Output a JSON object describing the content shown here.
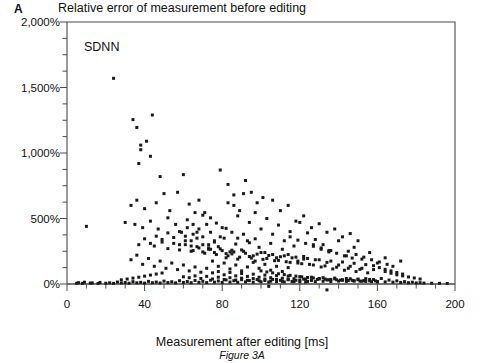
{
  "panel": {
    "label": "A"
  },
  "header": {
    "title": "Relative error of measurement before editing"
  },
  "caption": {
    "text": "Figure 3A"
  },
  "colors": {
    "marker": "#1a1a1a",
    "axis": "#4a4a4a",
    "background": "#ffffff",
    "text": "#111111"
  },
  "chart_data": {
    "type": "scatter",
    "title": "Relative error of measurement before editing",
    "series_label": "SDNN",
    "xlabel": "Measurement after editing [ms]",
    "ylabel": "",
    "xlim": [
      0,
      200
    ],
    "ylim": [
      0,
      2000
    ],
    "grid": false,
    "legend": "none",
    "x_major_ticks": [
      0,
      40,
      80,
      120,
      160,
      200
    ],
    "x_tick_labels": [
      "0",
      "40",
      "80",
      "120",
      "160",
      "200"
    ],
    "x_minor_step": 10,
    "y_major_ticks": [
      0,
      500,
      1000,
      1500,
      2000
    ],
    "y_tick_labels": [
      "0%",
      "500%",
      "1,000%",
      "1,500%",
      "2,000%"
    ],
    "y_minor_step": 125,
    "y_unit": "%",
    "marker": "square",
    "marker_size_px": 3,
    "n_points": 430,
    "points": [
      [
        10,
        440
      ],
      [
        24,
        1570
      ],
      [
        34,
        1255
      ],
      [
        36,
        1195
      ],
      [
        38,
        1060
      ],
      [
        38,
        1025
      ],
      [
        37,
        920
      ],
      [
        44,
        1290
      ],
      [
        41,
        1090
      ],
      [
        43,
        975
      ],
      [
        48,
        820
      ],
      [
        50,
        690
      ],
      [
        36,
        640
      ],
      [
        46,
        620
      ],
      [
        33,
        600
      ],
      [
        40,
        575
      ],
      [
        53,
        560
      ],
      [
        57,
        700
      ],
      [
        60,
        835
      ],
      [
        63,
        610
      ],
      [
        66,
        545
      ],
      [
        30,
        470
      ],
      [
        35,
        455
      ],
      [
        39,
        430
      ],
      [
        43,
        480
      ],
      [
        47,
        420
      ],
      [
        52,
        505
      ],
      [
        56,
        455
      ],
      [
        59,
        395
      ],
      [
        62,
        430
      ],
      [
        65,
        380
      ],
      [
        68,
        640
      ],
      [
        70,
        525
      ],
      [
        72,
        455
      ],
      [
        74,
        395
      ],
      [
        58,
        300
      ],
      [
        61,
        330
      ],
      [
        64,
        290
      ],
      [
        67,
        350
      ],
      [
        70,
        300
      ],
      [
        73,
        265
      ],
      [
        76,
        320
      ],
      [
        79,
        870
      ],
      [
        83,
        760
      ],
      [
        86,
        600
      ],
      [
        88,
        520
      ],
      [
        91,
        690
      ],
      [
        94,
        470
      ],
      [
        97,
        545
      ],
      [
        100,
        420
      ],
      [
        103,
        500
      ],
      [
        106,
        380
      ],
      [
        109,
        450
      ],
      [
        112,
        330
      ],
      [
        115,
        400
      ],
      [
        78,
        285
      ],
      [
        81,
        350
      ],
      [
        84,
        245
      ],
      [
        87,
        305
      ],
      [
        90,
        260
      ],
      [
        93,
        330
      ],
      [
        96,
        215
      ],
      [
        99,
        280
      ],
      [
        102,
        240
      ],
      [
        105,
        310
      ],
      [
        108,
        200
      ],
      [
        111,
        265
      ],
      [
        114,
        225
      ],
      [
        117,
        290
      ],
      [
        120,
        470
      ],
      [
        124,
        390
      ],
      [
        128,
        340
      ],
      [
        132,
        300
      ],
      [
        136,
        255
      ],
      [
        140,
        330
      ],
      [
        144,
        215
      ],
      [
        148,
        280
      ],
      [
        152,
        190
      ],
      [
        156,
        240
      ],
      [
        160,
        160
      ],
      [
        164,
        200
      ],
      [
        168,
        135
      ],
      [
        172,
        175
      ],
      [
        119,
        175
      ],
      [
        122,
        210
      ],
      [
        125,
        150
      ],
      [
        128,
        185
      ],
      [
        131,
        130
      ],
      [
        134,
        165
      ],
      [
        137,
        115
      ],
      [
        140,
        145
      ],
      [
        143,
        105
      ],
      [
        146,
        135
      ],
      [
        149,
        95
      ],
      [
        152,
        120
      ],
      [
        155,
        85
      ],
      [
        158,
        110
      ],
      [
        33,
        185
      ],
      [
        36,
        220
      ],
      [
        39,
        150
      ],
      [
        42,
        195
      ],
      [
        45,
        135
      ],
      [
        48,
        175
      ],
      [
        51,
        120
      ],
      [
        54,
        160
      ],
      [
        57,
        110
      ],
      [
        60,
        145
      ],
      [
        63,
        100
      ],
      [
        66,
        130
      ],
      [
        69,
        90
      ],
      [
        72,
        120
      ],
      [
        75,
        175
      ],
      [
        78,
        135
      ],
      [
        81,
        160
      ],
      [
        84,
        115
      ],
      [
        87,
        145
      ],
      [
        90,
        100
      ],
      [
        93,
        130
      ],
      [
        96,
        165
      ],
      [
        99,
        120
      ],
      [
        102,
        150
      ],
      [
        105,
        105
      ],
      [
        108,
        135
      ],
      [
        111,
        95
      ],
      [
        114,
        125
      ],
      [
        75,
        85
      ],
      [
        78,
        95
      ],
      [
        81,
        70
      ],
      [
        84,
        88
      ],
      [
        87,
        62
      ],
      [
        90,
        80
      ],
      [
        93,
        58
      ],
      [
        96,
        75
      ],
      [
        99,
        52
      ],
      [
        102,
        68
      ],
      [
        105,
        48
      ],
      [
        108,
        64
      ],
      [
        111,
        44
      ],
      [
        114,
        60
      ],
      [
        117,
        40
      ],
      [
        120,
        56
      ],
      [
        123,
        38
      ],
      [
        126,
        52
      ],
      [
        129,
        35
      ],
      [
        132,
        48
      ],
      [
        135,
        32
      ],
      [
        138,
        45
      ],
      [
        141,
        30
      ],
      [
        144,
        42
      ],
      [
        147,
        28
      ],
      [
        150,
        38
      ],
      [
        153,
        26
      ],
      [
        156,
        35
      ],
      [
        159,
        24
      ],
      [
        60,
        55
      ],
      [
        63,
        48
      ],
      [
        66,
        62
      ],
      [
        69,
        42
      ],
      [
        72,
        58
      ],
      [
        75,
        38
      ],
      [
        78,
        52
      ],
      [
        81,
        34
      ],
      [
        84,
        48
      ],
      [
        87,
        30
      ],
      [
        90,
        45
      ],
      [
        93,
        28
      ],
      [
        96,
        42
      ],
      [
        99,
        25
      ],
      [
        102,
        38
      ],
      [
        105,
        22
      ],
      [
        108,
        35
      ],
      [
        111,
        20
      ],
      [
        114,
        32
      ],
      [
        117,
        18
      ],
      [
        120,
        30
      ],
      [
        123,
        16
      ],
      [
        126,
        28
      ],
      [
        6,
        10
      ],
      [
        9,
        14
      ],
      [
        13,
        8
      ],
      [
        17,
        12
      ],
      [
        22,
        9
      ],
      [
        26,
        15
      ],
      [
        30,
        11
      ],
      [
        34,
        18
      ],
      [
        38,
        13
      ],
      [
        42,
        20
      ],
      [
        46,
        15
      ],
      [
        50,
        22
      ],
      [
        54,
        17
      ],
      [
        58,
        25
      ],
      [
        62,
        19
      ],
      [
        66,
        27
      ],
      [
        70,
        21
      ],
      [
        74,
        29
      ],
      [
        78,
        23
      ],
      [
        82,
        31
      ],
      [
        86,
        25
      ],
      [
        90,
        33
      ],
      [
        94,
        26
      ],
      [
        98,
        34
      ],
      [
        102,
        27
      ],
      [
        106,
        35
      ],
      [
        110,
        28
      ],
      [
        114,
        36
      ],
      [
        118,
        29
      ],
      [
        122,
        37
      ],
      [
        126,
        30
      ],
      [
        130,
        38
      ],
      [
        134,
        31
      ],
      [
        138,
        39
      ],
      [
        142,
        32
      ],
      [
        146,
        40
      ],
      [
        150,
        33
      ],
      [
        154,
        41
      ],
      [
        158,
        34
      ],
      [
        162,
        42
      ],
      [
        166,
        30
      ],
      [
        170,
        24
      ],
      [
        174,
        18
      ],
      [
        178,
        14
      ],
      [
        182,
        10
      ],
      [
        5,
        6
      ],
      [
        8,
        5
      ],
      [
        12,
        7
      ],
      [
        16,
        4
      ],
      [
        20,
        6
      ],
      [
        24,
        5
      ],
      [
        28,
        8
      ],
      [
        32,
        6
      ],
      [
        36,
        9
      ],
      [
        40,
        7
      ],
      [
        44,
        10
      ],
      [
        48,
        8
      ],
      [
        52,
        11
      ],
      [
        56,
        9
      ],
      [
        60,
        12
      ],
      [
        64,
        10
      ],
      [
        68,
        13
      ],
      [
        72,
        11
      ],
      [
        76,
        14
      ],
      [
        80,
        12
      ],
      [
        84,
        15
      ],
      [
        88,
        13
      ],
      [
        92,
        16
      ],
      [
        96,
        14
      ],
      [
        100,
        17
      ],
      [
        104,
        15
      ],
      [
        108,
        18
      ],
      [
        112,
        16
      ],
      [
        116,
        19
      ],
      [
        120,
        17
      ],
      [
        124,
        20
      ],
      [
        128,
        18
      ],
      [
        132,
        21
      ],
      [
        136,
        19
      ],
      [
        140,
        22
      ],
      [
        144,
        20
      ],
      [
        148,
        23
      ],
      [
        152,
        21
      ],
      [
        156,
        24
      ],
      [
        160,
        19
      ],
      [
        164,
        16
      ],
      [
        168,
        14
      ],
      [
        172,
        12
      ],
      [
        176,
        10
      ],
      [
        180,
        8
      ],
      [
        184,
        7
      ],
      [
        188,
        6
      ],
      [
        192,
        5
      ],
      [
        196,
        4
      ],
      [
        82,
        200
      ],
      [
        85,
        230
      ],
      [
        88,
        190
      ],
      [
        91,
        250
      ],
      [
        94,
        210
      ],
      [
        97,
        175
      ],
      [
        100,
        240
      ],
      [
        103,
        195
      ],
      [
        106,
        225
      ],
      [
        109,
        180
      ],
      [
        112,
        215
      ],
      [
        115,
        165
      ],
      [
        118,
        205
      ],
      [
        121,
        155
      ],
      [
        124,
        195
      ],
      [
        127,
        145
      ],
      [
        130,
        185
      ],
      [
        133,
        138
      ],
      [
        136,
        175
      ],
      [
        139,
        128
      ],
      [
        142,
        168
      ],
      [
        145,
        120
      ],
      [
        148,
        158
      ],
      [
        151,
        112
      ],
      [
        154,
        148
      ],
      [
        65,
        255
      ],
      [
        68,
        275
      ],
      [
        71,
        235
      ],
      [
        74,
        265
      ],
      [
        77,
        225
      ],
      [
        80,
        255
      ],
      [
        83,
        215
      ],
      [
        86,
        245
      ],
      [
        89,
        205
      ],
      [
        92,
        235
      ],
      [
        95,
        198
      ],
      [
        98,
        228
      ],
      [
        101,
        188
      ],
      [
        104,
        218
      ],
      [
        107,
        178
      ],
      [
        110,
        208
      ],
      [
        113,
        170
      ],
      [
        116,
        200
      ],
      [
        119,
        160
      ],
      [
        122,
        190
      ],
      [
        45,
        290
      ],
      [
        49,
        320
      ],
      [
        52,
        270
      ],
      [
        55,
        310
      ],
      [
        58,
        260
      ],
      [
        61,
        300
      ],
      [
        64,
        250
      ],
      [
        67,
        285
      ],
      [
        70,
        245
      ],
      [
        73,
        275
      ],
      [
        76,
        240
      ],
      [
        79,
        268
      ],
      [
        82,
        232
      ],
      [
        85,
        258
      ],
      [
        106,
        640
      ],
      [
        110,
        560
      ],
      [
        114,
        600
      ],
      [
        118,
        480
      ],
      [
        122,
        520
      ],
      [
        126,
        430
      ],
      [
        130,
        460
      ],
      [
        134,
        395
      ],
      [
        138,
        420
      ],
      [
        142,
        360
      ],
      [
        146,
        385
      ],
      [
        150,
        330
      ],
      [
        92,
        790
      ],
      [
        95,
        700
      ],
      [
        98,
        620
      ],
      [
        101,
        660
      ],
      [
        89,
        560
      ],
      [
        86,
        680
      ],
      [
        83,
        620
      ],
      [
        80,
        430
      ],
      [
        77,
        465
      ],
      [
        74,
        505
      ],
      [
        71,
        545
      ],
      [
        68,
        420
      ],
      [
        65,
        455
      ],
      [
        62,
        490
      ],
      [
        52,
        390
      ],
      [
        55,
        355
      ],
      [
        49,
        340
      ],
      [
        46,
        365
      ],
      [
        43,
        310
      ],
      [
        40,
        345
      ],
      [
        37,
        300
      ],
      [
        134,
        -45
      ],
      [
        104,
        -18
      ],
      [
        218,
        0
      ],
      [
        164,
        95
      ],
      [
        167,
        82
      ],
      [
        170,
        70
      ],
      [
        173,
        62
      ],
      [
        176,
        54
      ],
      [
        179,
        46
      ],
      [
        182,
        38
      ],
      [
        158,
        140
      ],
      [
        161,
        125
      ],
      [
        164,
        112
      ],
      [
        167,
        100
      ],
      [
        170,
        88
      ],
      [
        173,
        76
      ],
      [
        145,
        250
      ],
      [
        149,
        225
      ],
      [
        153,
        205
      ],
      [
        157,
        185
      ],
      [
        161,
        168
      ],
      [
        165,
        150
      ],
      [
        127,
        300
      ],
      [
        131,
        275
      ],
      [
        135,
        255
      ],
      [
        139,
        235
      ],
      [
        143,
        215
      ],
      [
        147,
        198
      ],
      [
        115,
        360
      ],
      [
        119,
        335
      ],
      [
        123,
        310
      ],
      [
        127,
        288
      ],
      [
        131,
        265
      ],
      [
        135,
        245
      ],
      [
        100,
        100
      ],
      [
        103,
        92
      ],
      [
        106,
        85
      ],
      [
        109,
        78
      ],
      [
        112,
        72
      ],
      [
        115,
        66
      ],
      [
        118,
        60
      ],
      [
        121,
        55
      ],
      [
        124,
        50
      ],
      [
        127,
        46
      ],
      [
        130,
        42
      ],
      [
        133,
        38
      ],
      [
        136,
        35
      ],
      [
        139,
        32
      ],
      [
        142,
        29
      ],
      [
        145,
        26
      ],
      [
        148,
        24
      ],
      [
        151,
        22
      ],
      [
        154,
        20
      ],
      [
        157,
        18
      ],
      [
        160,
        16
      ],
      [
        40,
        60
      ],
      [
        43,
        68
      ],
      [
        46,
        76
      ],
      [
        49,
        84
      ],
      [
        37,
        52
      ],
      [
        34,
        45
      ],
      [
        31,
        38
      ],
      [
        28,
        32
      ],
      [
        88,
        350
      ],
      [
        91,
        380
      ],
      [
        94,
        315
      ],
      [
        97,
        345
      ],
      [
        85,
        395
      ],
      [
        82,
        425
      ],
      [
        79,
        360
      ],
      [
        76,
        330
      ],
      [
        73,
        300
      ],
      [
        70,
        360
      ],
      [
        67,
        395
      ],
      [
        64,
        330
      ],
      [
        61,
        365
      ],
      [
        58,
        400
      ]
    ]
  },
  "geometry": {
    "plot_left": 67,
    "plot_right": 455,
    "plot_top": 22,
    "plot_bottom": 284
  }
}
